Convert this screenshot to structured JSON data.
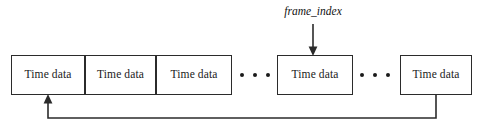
{
  "diagram": {
    "type": "circular-buffer-schematic",
    "canvas": {
      "width": 483,
      "height": 125,
      "background": "#ffffff"
    },
    "stroke_color": "#2b2b2b",
    "text_color": "#1a1a1a",
    "cells": [
      {
        "id": "cell-1",
        "label": "Time data",
        "x": 11,
        "y": 55,
        "width": 74,
        "height": 40
      },
      {
        "id": "cell-2",
        "label": "Time data",
        "x": 85,
        "y": 55,
        "width": 71,
        "height": 40
      },
      {
        "id": "cell-3",
        "label": "Time data",
        "x": 156,
        "y": 55,
        "width": 76,
        "height": 40
      },
      {
        "id": "cell-4",
        "label": "Time data",
        "x": 277,
        "y": 55,
        "width": 76,
        "height": 40
      },
      {
        "id": "cell-5",
        "label": "Time data",
        "x": 400,
        "y": 55,
        "width": 72,
        "height": 40
      }
    ],
    "ellipses": [
      {
        "id": "ellipsis-1",
        "x": 240,
        "y": 70,
        "width": 30,
        "dots": 3
      },
      {
        "id": "ellipsis-2",
        "x": 360,
        "y": 70,
        "width": 30,
        "dots": 3
      }
    ],
    "pointer": {
      "label": "frame_index",
      "label_x": 262,
      "label_y": 6,
      "label_width": 102,
      "arrow_x": 313,
      "arrow_from_y": 24,
      "arrow_to_y": 55
    },
    "feedback_loop": {
      "from_cell": "cell-5",
      "to_cell": "cell-1",
      "start_x": 436,
      "start_y": 95,
      "bottom_y": 118,
      "end_x": 48,
      "end_y": 95
    }
  }
}
